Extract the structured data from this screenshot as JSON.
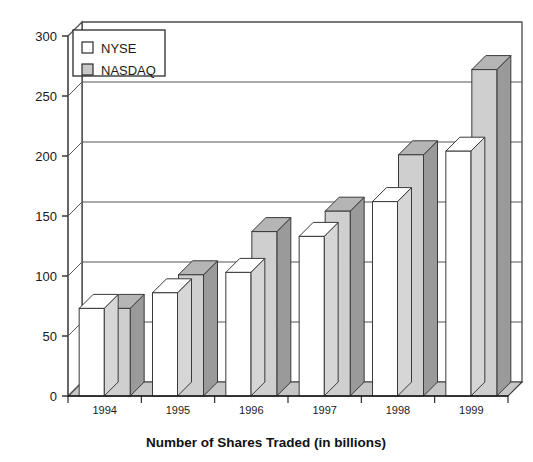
{
  "chart_data": {
    "type": "bar",
    "title": "Number of Shares Traded (in billions)",
    "xlabel": "",
    "ylabel": "",
    "categories": [
      "1994",
      "1995",
      "1996",
      "1997",
      "1998",
      "1999"
    ],
    "series": [
      {
        "name": "NYSE",
        "color": "#ffffff",
        "values": [
          73,
          86,
          103,
          133,
          162,
          204
        ]
      },
      {
        "name": "NASDAQ",
        "color": "#c9c9c9",
        "values": [
          73,
          101,
          137,
          154,
          201,
          272
        ]
      }
    ],
    "ylim": [
      0,
      300
    ],
    "yticks": [
      0,
      50,
      100,
      150,
      200,
      250,
      300
    ],
    "ytick_labels": [
      "0",
      "50",
      "100",
      "150",
      "200",
      "250",
      "300"
    ],
    "grid": true,
    "grid_axis": "y",
    "legend_position": "top-left",
    "style": "3d-bar"
  },
  "legend": {
    "entries": [
      {
        "label": "NYSE",
        "swatch": "#ffffff"
      },
      {
        "label": "NASDAQ",
        "swatch": "#c9c9c9"
      }
    ]
  },
  "axis": {
    "y_tick_labels": [
      "300",
      "250",
      "200",
      "150",
      "100",
      "50",
      "0"
    ],
    "x_tick_labels": [
      "1994",
      "1995",
      "1996",
      "1997",
      "1998",
      "1999"
    ]
  },
  "title": {
    "text": "Number of Shares Traded (in billions)"
  },
  "colors": {
    "bar_nyse_front": "#ffffff",
    "bar_nyse_side": "#d6d6d6",
    "bar_nyse_top": "#ffffff",
    "bar_nasdaq_front": "#cfcfcf",
    "bar_nasdaq_side": "#9a9a9a",
    "bar_nasdaq_top": "#b5b5b5",
    "floor": "#c6c6c6",
    "wall": "#ffffff",
    "outline": "#3a3a3a",
    "grid": "#555555",
    "text": "#1a1a1a"
  }
}
